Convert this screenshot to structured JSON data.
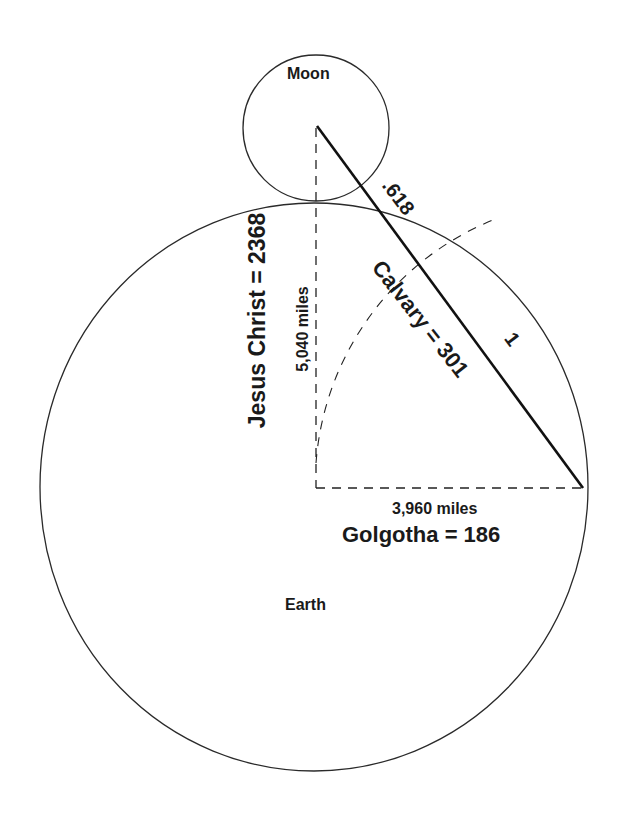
{
  "diagram": {
    "labels": {
      "moon": "Moon",
      "earth": "Earth",
      "ratio_small": ".618",
      "ratio_one": "1",
      "calvary": "Calvary = 301",
      "jesus": "Jesus Christ = 2368",
      "vertical_distance": "5,040 miles",
      "horizontal_distance": "3,960 miles",
      "golgotha": "Golgotha = 186"
    },
    "shapes": {
      "moon_circle": {
        "cx": 316,
        "cy": 128,
        "r": 73
      },
      "earth_circle": {
        "cx": 314,
        "cy": 487,
        "rx": 274,
        "ry": 284
      },
      "hypotenuse": {
        "x1": 317,
        "y1": 126,
        "x2": 583,
        "y2": 488
      },
      "vertical_dashed": {
        "x": 316,
        "y1": 126,
        "y2": 488
      },
      "horizontal_dashed": {
        "y": 488,
        "x1": 316,
        "x2": 583
      }
    },
    "colors": {
      "stroke": "#222222",
      "background": "#ffffff"
    }
  }
}
